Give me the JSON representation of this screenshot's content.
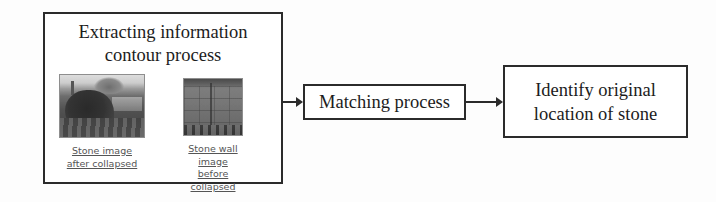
{
  "diagram": {
    "background_color": "#fdfdfd",
    "line_color": "#2b2b2b",
    "nodes": {
      "extracting": {
        "label_line1": "Extracting information",
        "label_line2": "contour process",
        "photos": [
          {
            "name": "stone-image-after-collapsed",
            "caption_line1": "Stone image",
            "caption_line2": "after collapsed",
            "description": "dark grayscale photograph of a collapsed stone wall with vegetation"
          },
          {
            "name": "stone-wall-image-before-collapsed",
            "caption_line1": "Stone wall image",
            "caption_line2": "before collapsed",
            "description": "mid-gray photograph of an intact stone wall texture"
          }
        ]
      },
      "matching": {
        "label": "Matching process"
      },
      "identify": {
        "label_line1": "Identify original",
        "label_line2": "location of stone"
      }
    },
    "connectors": [
      {
        "name": "arrow-extracting-to-matching",
        "glyph": "arrow-right-icon"
      },
      {
        "name": "arrow-matching-to-identify",
        "glyph": "arrow-right-icon"
      }
    ]
  }
}
